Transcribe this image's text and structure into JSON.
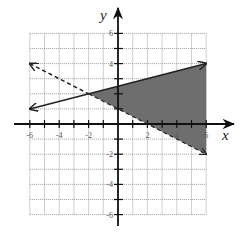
{
  "chart_data": {
    "type": "line",
    "title": "",
    "xlabel": "x",
    "ylabel": "y",
    "xlim": [
      -6,
      6
    ],
    "ylim": [
      -6,
      6
    ],
    "grid": true,
    "x_tick_labels": [
      "-6",
      "-4",
      "-2",
      "2",
      "4",
      "6"
    ],
    "y_tick_labels": [
      "6",
      "4",
      "-2",
      "-4",
      "-6"
    ],
    "series": [
      {
        "name": "boundary-solid",
        "style": "solid",
        "equation": "y = x/4 + 5/2",
        "points": [
          [
            -6,
            1
          ],
          [
            6,
            4
          ]
        ],
        "arrows": "both"
      },
      {
        "name": "boundary-dashed",
        "style": "dashed",
        "equation": "y = -x/2 + 1",
        "points": [
          [
            -6,
            4
          ],
          [
            6,
            -2
          ]
        ],
        "arrows": "both"
      }
    ],
    "shaded_region": {
      "polygon": [
        [
          -2,
          2
        ],
        [
          6,
          4
        ],
        [
          6,
          -2
        ]
      ],
      "color": "#6e6e6e",
      "description": "region right of the intersection (-2, 2), between the two lines"
    },
    "intersection": [
      -2,
      2
    ]
  },
  "labels": {
    "x_axis": "x",
    "y_axis": "y",
    "xticks": [
      {
        "v": -6,
        "t": "-6"
      },
      {
        "v": -4,
        "t": "-4"
      },
      {
        "v": -2,
        "t": "-2"
      },
      {
        "v": 2,
        "t": "2"
      },
      {
        "v": 4,
        "t": "4"
      },
      {
        "v": 6,
        "t": "6"
      }
    ],
    "yticks": [
      {
        "v": 6,
        "t": "6"
      },
      {
        "v": 4,
        "t": "4"
      },
      {
        "v": -2,
        "t": "-2"
      },
      {
        "v": -4,
        "t": "-4"
      },
      {
        "v": -6,
        "t": "-6"
      }
    ]
  },
  "colors": {
    "grid": "#9a9a9a",
    "axis": "#111111",
    "line": "#222222",
    "shade": "#6e6e6e"
  }
}
